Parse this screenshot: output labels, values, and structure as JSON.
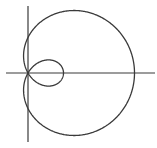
{
  "diagram": {
    "type": "polar-curve",
    "curve": "limacon-with-inner-loop",
    "equation_form": "r = a + b cos(theta)",
    "a": 1,
    "b": 2,
    "pixel_scale": 35.5,
    "origin_px": [
      28,
      73
    ],
    "colors": {
      "background": "#ffffff",
      "stroke": "#3a3a3a",
      "axis": "#3a3a3a"
    },
    "axes": {
      "x_axis_px": {
        "x1": 6,
        "x2": 155,
        "y": 73
      },
      "y_axis_px": {
        "x": 28,
        "y1": 6,
        "y2": 142
      }
    }
  }
}
